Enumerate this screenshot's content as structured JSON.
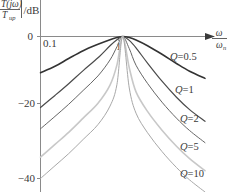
{
  "chart_data": {
    "type": "line",
    "title": "",
    "ylabel": "|T(jω)/T_up| /dB",
    "ylabel_parts": {
      "numerator": "T(jω)",
      "denominator": "T",
      "denominator_sub": "up",
      "unit": "/dB"
    },
    "xlabel": "ω/ωₙ",
    "xlabel_parts": {
      "numerator": "ω",
      "denominator": "ω",
      "denominator_sub": "n"
    },
    "xscale": "log",
    "xlim": [
      0.1,
      10
    ],
    "ylim": [
      -45,
      3
    ],
    "xticks": [
      0.1,
      1
    ],
    "xtick_labels": [
      "0.1",
      "1"
    ],
    "yticks": [
      0,
      -20,
      -40
    ],
    "ytick_labels": [
      "0",
      "−20",
      "−40"
    ],
    "grid": false,
    "legend_position": "inline-right",
    "series": [
      {
        "name": "Q=0.5",
        "label": "Q=0.5",
        "color": "#333333",
        "width": 1.6,
        "q": 0.5,
        "x": [
          0.1,
          0.15,
          0.22,
          0.33,
          0.5,
          0.7,
          0.85,
          1.0,
          1.2,
          1.45,
          2.0,
          3.0,
          4.5,
          6.5,
          10.0
        ],
        "y": [
          -10.2,
          -8.4,
          -6.2,
          -4.0,
          -2.2,
          -0.9,
          -0.3,
          0.0,
          -0.3,
          -1.0,
          -2.6,
          -5.0,
          -7.6,
          -9.8,
          -11.8
        ]
      },
      {
        "name": "Q=1",
        "label": "Q=1",
        "color": "#4a4a4a",
        "width": 1.2,
        "q": 1.0,
        "x": [
          0.1,
          0.15,
          0.22,
          0.33,
          0.5,
          0.7,
          0.85,
          1.0,
          1.2,
          1.45,
          2.0,
          3.0,
          4.5,
          6.5,
          10.0
        ],
        "y": [
          -20.0,
          -16.6,
          -13.3,
          -9.6,
          -6.0,
          -2.6,
          -0.9,
          0.0,
          -1.1,
          -3.2,
          -7.5,
          -12.6,
          -17.1,
          -20.6,
          -23.9
        ]
      },
      {
        "name": "Q=2",
        "label": "Q=2",
        "color": "#666666",
        "width": 1.0,
        "q": 2.0,
        "x": [
          0.1,
          0.15,
          0.22,
          0.33,
          0.5,
          0.7,
          0.85,
          1.0,
          1.2,
          1.45,
          2.0,
          3.0,
          4.5,
          6.5,
          10.0
        ],
        "y": [
          -26.0,
          -22.5,
          -19.1,
          -15.2,
          -11.1,
          -6.6,
          -2.9,
          0.0,
          -3.4,
          -8.1,
          -13.2,
          -18.5,
          -23.0,
          -26.5,
          -29.9
        ]
      },
      {
        "name": "Q=5",
        "label": "Q=5",
        "color": "#c8c8c8",
        "width": 1.6,
        "q": 5.0,
        "x": [
          0.1,
          0.15,
          0.22,
          0.33,
          0.5,
          0.7,
          0.85,
          1.0,
          1.2,
          1.45,
          2.0,
          3.0,
          4.5,
          6.5,
          10.0
        ],
        "y": [
          -34.0,
          -30.4,
          -27.0,
          -23.0,
          -18.8,
          -13.7,
          -8.0,
          0.0,
          -8.8,
          -15.6,
          -21.1,
          -26.4,
          -30.9,
          -34.4,
          -37.8
        ]
      },
      {
        "name": "Q=10",
        "label": "Q=10",
        "color": "#a8a8a8",
        "width": 1.0,
        "q": 10.0,
        "x": [
          0.1,
          0.15,
          0.22,
          0.33,
          0.5,
          0.7,
          0.85,
          1.0,
          1.2,
          1.45,
          2.0,
          3.0,
          4.5,
          6.5,
          10.0
        ],
        "y": [
          -40.0,
          -36.4,
          -33.0,
          -29.0,
          -24.8,
          -19.6,
          -13.5,
          0.0,
          -14.5,
          -21.6,
          -27.1,
          -32.4,
          -36.9,
          -40.4,
          -43.8
        ]
      }
    ],
    "annotations": [
      {
        "text": "Q=0.5",
        "x": 170,
        "y": 60
      },
      {
        "text": "Q=1",
        "x": 175,
        "y": 93
      },
      {
        "text": "Q=2",
        "x": 180,
        "y": 122
      },
      {
        "text": "Q=5",
        "x": 180,
        "y": 150
      },
      {
        "text": "Q=10",
        "x": 180,
        "y": 177
      }
    ]
  }
}
